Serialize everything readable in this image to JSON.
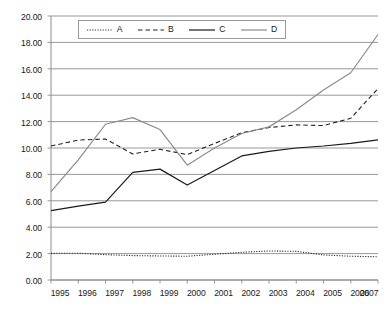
{
  "chart_data": {
    "type": "line",
    "title": "",
    "subtitle": "",
    "xlabel": "",
    "ylabel": "",
    "x": [
      1995,
      1996,
      1997,
      1998,
      1999,
      2000,
      2001,
      2002,
      2003,
      2004,
      2005,
      2006,
      2007
    ],
    "categories": [
      "1995",
      "1996",
      "1997",
      "1998",
      "1999",
      "2000",
      "2001",
      "2002",
      "2003",
      "2004",
      "2005",
      "2006",
      "2007"
    ],
    "ylim": [
      0.0,
      20.0
    ],
    "y_tick_step": 2.0,
    "y_tick_labels": [
      "20.00",
      "18.00",
      "16.00",
      "14.00",
      "12.00",
      "10.00",
      "8.00",
      "6.00",
      "4.00",
      "2.00",
      "0.00"
    ],
    "y_tick_values": [
      20.0,
      18.0,
      16.0,
      14.0,
      12.0,
      10.0,
      8.0,
      6.0,
      4.0,
      2.0,
      0.0
    ],
    "grid": "horizontal",
    "legend_position": "top-center",
    "series": [
      {
        "name": "A",
        "style": "dotted",
        "color": "#333333",
        "values": [
          2.02,
          2.03,
          1.92,
          1.85,
          1.82,
          1.8,
          1.95,
          2.1,
          2.2,
          2.17,
          1.9,
          1.8,
          1.76
        ]
      },
      {
        "name": "B",
        "style": "dashed",
        "color": "#222222",
        "values": [
          10.15,
          10.6,
          10.68,
          9.55,
          9.9,
          9.5,
          10.35,
          11.15,
          11.55,
          11.75,
          11.7,
          12.25,
          14.5
        ]
      },
      {
        "name": "C",
        "style": "solid",
        "color": "#1a1a1a",
        "values": [
          5.25,
          5.6,
          5.9,
          8.15,
          8.4,
          7.2,
          8.3,
          9.4,
          9.75,
          10.0,
          10.15,
          10.35,
          10.62
        ]
      },
      {
        "name": "D",
        "style": "solid",
        "color": "#8c8c8c",
        "values": [
          6.7,
          9.1,
          11.8,
          12.3,
          11.4,
          8.7,
          10.0,
          11.1,
          11.6,
          12.9,
          14.4,
          15.7,
          18.6
        ]
      }
    ]
  },
  "legend": {
    "entries": [
      {
        "label": "A",
        "style": "dotted"
      },
      {
        "label": "B",
        "style": "dashed"
      },
      {
        "label": "C",
        "style": "solid-dark"
      },
      {
        "label": "D",
        "style": "solid-gray"
      }
    ]
  },
  "colors": {
    "grid": "#8c8c8c",
    "axis": "#8c8c8c",
    "text": "#1a1a1a",
    "series_a": "#333333",
    "series_b": "#222222",
    "series_c": "#1a1a1a",
    "series_d": "#8c8c8c",
    "background": "#ffffff"
  }
}
